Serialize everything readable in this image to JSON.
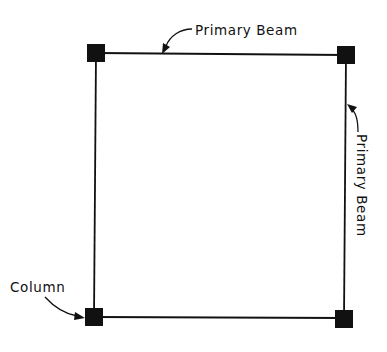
{
  "diagram": {
    "type": "structural-framing-plan",
    "colors": {
      "line": "#111111",
      "column": "#111111",
      "background": "#ffffff"
    },
    "labels": {
      "top_beam": "Primary Beam",
      "right_beam": "Primary Beam",
      "column": "Column"
    },
    "columns": [
      {
        "id": "top-left"
      },
      {
        "id": "top-right"
      },
      {
        "id": "bottom-left"
      },
      {
        "id": "bottom-right"
      }
    ],
    "beams": [
      {
        "id": "top",
        "label": "Primary Beam"
      },
      {
        "id": "right",
        "label": "Primary Beam"
      },
      {
        "id": "bottom"
      },
      {
        "id": "left"
      }
    ]
  }
}
